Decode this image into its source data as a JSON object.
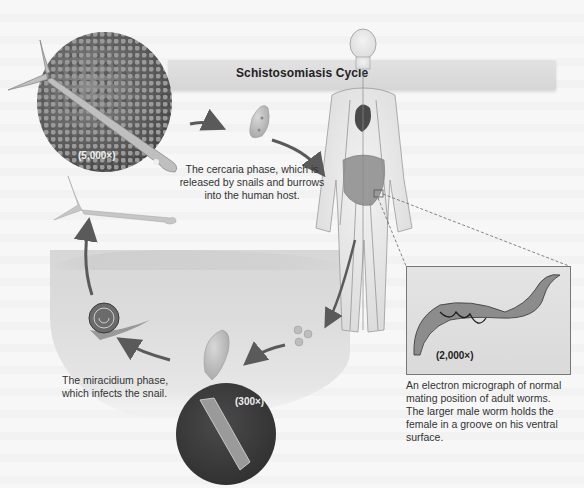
{
  "diagram": {
    "title": "Schistosomiasis Cycle",
    "stages": [
      {
        "id": "cercaria",
        "magnification": "(5,000×)",
        "caption": [
          "The cercaria phase, which is",
          "released by snails and burrows",
          "into the human host."
        ]
      },
      {
        "id": "adult-worms",
        "magnification": "(2,000×)",
        "caption": [
          "An electron micrograph of normal",
          "mating position of adult worms.",
          "The larger male worm holds the",
          "female in a groove on his ventral",
          "surface."
        ]
      },
      {
        "id": "eggs",
        "label": ""
      },
      {
        "id": "sporocyst",
        "magnification": "(300×)"
      },
      {
        "id": "miracidium",
        "caption": [
          "The miracidium phase,",
          "which infects the snail."
        ]
      },
      {
        "id": "snail",
        "label": ""
      }
    ],
    "colors": {
      "background": "#f7f7f7",
      "title_bar": "#dcdcdc",
      "arrow": "#5a5a5a",
      "micrograph_dark": "#333333",
      "text": "#333333"
    }
  }
}
